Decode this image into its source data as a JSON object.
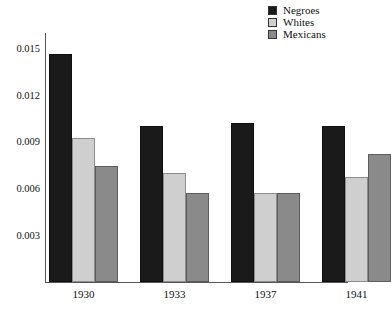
{
  "chart_data": {
    "type": "bar",
    "title": "",
    "subtitle": "",
    "xlabel": "",
    "ylabel": "",
    "categories": [
      "1930",
      "1933",
      "1937",
      "1941"
    ],
    "series": [
      {
        "name": "Negroes",
        "color": "#1a1a1a",
        "values": [
          0.0146,
          0.01,
          0.0102,
          0.01
        ]
      },
      {
        "name": "Whites",
        "color": "#cfcfcf",
        "values": [
          0.0092,
          0.007,
          0.0057,
          0.0067
        ]
      },
      {
        "name": "Mexicans",
        "color": "#8a8a8a",
        "values": [
          0.0074,
          0.0057,
          0.0057,
          0.0082
        ]
      }
    ],
    "yticks": [
      0.003,
      0.006,
      0.009,
      0.012,
      0.015
    ],
    "ytick_labels": [
      "0.003",
      "0.006",
      "0.009",
      "0.012",
      "0.015"
    ],
    "ylim": [
      0,
      0.016
    ],
    "grid": false,
    "legend_position": "top-right",
    "annotations": []
  },
  "legend": {
    "items": [
      {
        "label": "Negroes"
      },
      {
        "label": "Whites"
      },
      {
        "label": "Mexicans"
      }
    ]
  }
}
